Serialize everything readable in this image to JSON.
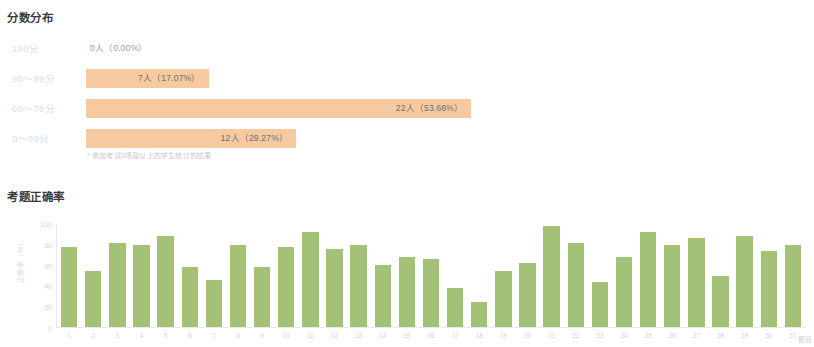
{
  "score_distribution": {
    "title": "分数分布",
    "note": "* 参加考试3场及以上的学生统计的结果",
    "bar_color": "#f7c9a1",
    "label_color": "#cfe2ef",
    "rows": [
      {
        "label": "100分",
        "value_text": "0人（0.00%）",
        "count": 0,
        "percent": 0.0,
        "inside": false
      },
      {
        "label": "80～99分",
        "value_text": "7人（17.07%）",
        "count": 7,
        "percent": 17.07,
        "inside": true
      },
      {
        "label": "60～79分",
        "value_text": "22人（53.66%）",
        "count": 22,
        "percent": 53.66,
        "inside": true
      },
      {
        "label": "0～59分",
        "value_text": "12人（29.27%）",
        "count": 12,
        "percent": 29.27,
        "inside": true
      }
    ]
  },
  "accuracy": {
    "title": "考题正确率",
    "bar_color": "#a3c278"
  },
  "chart_data": [
    {
      "type": "bar",
      "orientation": "horizontal",
      "title": "分数分布",
      "categories": [
        "100分",
        "80～99分",
        "60～79分",
        "0～59分"
      ],
      "values": [
        0.0,
        17.07,
        53.66,
        29.27
      ],
      "counts": [
        0,
        7,
        22,
        12
      ],
      "data_labels": [
        "0人（0.00%）",
        "7人（17.07%）",
        "22人（53.66%）",
        "12人（29.27%）"
      ],
      "xlabel": "",
      "ylabel": "",
      "xlim": [
        0,
        100
      ],
      "grid": false,
      "legend": "none",
      "annotations": [
        "* 参加考试3场及以上的学生统计的结果"
      ]
    },
    {
      "type": "bar",
      "orientation": "vertical",
      "title": "考题正确率",
      "categories": [
        "1",
        "2",
        "3",
        "4",
        "5",
        "6",
        "7",
        "8",
        "9",
        "10",
        "11",
        "12",
        "13",
        "14",
        "15",
        "16",
        "17",
        "18",
        "19",
        "20",
        "21",
        "22",
        "23",
        "24",
        "25",
        "26",
        "27",
        "28",
        "29",
        "30",
        "31"
      ],
      "values": [
        78,
        54,
        82,
        80,
        88,
        58,
        46,
        80,
        58,
        78,
        92,
        76,
        80,
        60,
        68,
        66,
        38,
        24,
        54,
        62,
        98,
        82,
        44,
        68,
        92,
        80,
        86,
        50,
        88,
        74,
        80
      ],
      "title_axis_x": "题目",
      "ylabel": "正确率（%）",
      "xlabel": "题目",
      "ylim": [
        0,
        100
      ],
      "yticks": [
        0,
        20,
        40,
        60,
        80,
        100
      ],
      "grid": false,
      "legend": "none"
    }
  ]
}
